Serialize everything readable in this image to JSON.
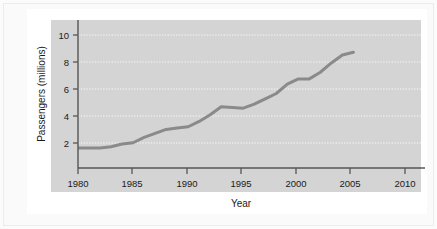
{
  "figure": {
    "background_color": "#ffffff",
    "plot_area_color": "#d4d4d4",
    "line_color": "#8a8a8a",
    "axis_color": "#555555",
    "grid_color": "#f2f2f2",
    "text_color": "#1a1a1a"
  },
  "chart_data": {
    "type": "line",
    "title": "",
    "xlabel": "Year",
    "ylabel": "Passengers (millions)",
    "xlim": [
      1980,
      2011.5
    ],
    "ylim": [
      0,
      10.6
    ],
    "xticks": [
      1980,
      1985,
      1990,
      1995,
      2000,
      2005,
      2010
    ],
    "xticklabels": [
      "1980",
      "1985",
      "1990",
      "1995",
      "2000",
      "2005",
      "2010"
    ],
    "yticks": [
      2,
      4,
      6,
      8,
      10
    ],
    "yticklabels": [
      "2",
      "4",
      "6",
      "8",
      "10"
    ],
    "grid": true,
    "grid_axis": "y",
    "grid_style": "dotted",
    "legend": null,
    "series": [
      {
        "name": "Passengers",
        "x": [
          1980,
          1981,
          1982,
          1983,
          1984,
          1985,
          1986,
          1987,
          1988,
          1989,
          1990,
          1991,
          1992,
          1993,
          1994,
          1995,
          1996,
          1997,
          1998,
          1999,
          2000,
          2001,
          2002,
          2003,
          2004,
          2005
        ],
        "values": [
          1.5,
          1.5,
          1.5,
          1.6,
          1.8,
          1.9,
          2.3,
          2.6,
          2.9,
          3.0,
          3.1,
          3.5,
          4.0,
          4.6,
          4.55,
          4.5,
          4.8,
          5.2,
          5.6,
          6.3,
          6.7,
          6.7,
          7.2,
          7.9,
          8.5,
          8.7
        ]
      }
    ]
  }
}
